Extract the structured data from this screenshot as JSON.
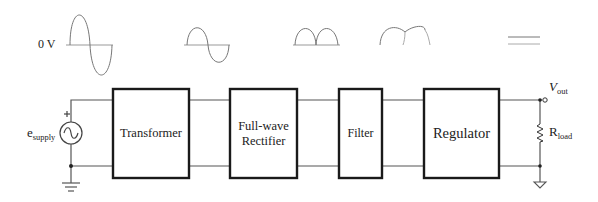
{
  "axis_label": "0 V",
  "source": {
    "label": "e",
    "subscript": "supply",
    "polarity": "+"
  },
  "blocks": [
    {
      "id": "transformer",
      "label": "Transformer"
    },
    {
      "id": "rectifier",
      "label_line1": "Full-wave",
      "label_line2": "Rectifier"
    },
    {
      "id": "filter",
      "label": "Filter"
    },
    {
      "id": "regulator",
      "label": "Regulator"
    }
  ],
  "output": {
    "label": "V",
    "subscript": "out"
  },
  "load": {
    "label": "R",
    "subscript": "load"
  },
  "waveforms": [
    {
      "stage": "supply",
      "shape": "large-sine"
    },
    {
      "stage": "transformer",
      "shape": "small-sine"
    },
    {
      "stage": "rectifier",
      "shape": "full-wave-rectified"
    },
    {
      "stage": "filter",
      "shape": "rippled-dc"
    },
    {
      "stage": "regulator",
      "shape": "flat-dc"
    }
  ],
  "colors": {
    "box": "#1a1a1a",
    "wire": "#555555",
    "wave": "#777777"
  }
}
